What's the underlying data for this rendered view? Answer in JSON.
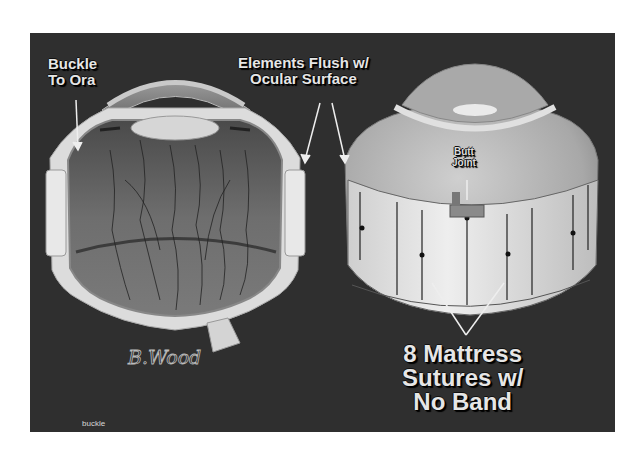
{
  "figure": {
    "type": "medical illustration",
    "labels": {
      "buckle_to_ora": [
        "Buckle",
        "To Ora"
      ],
      "elements_flush": [
        "Elements Flush w/",
        "Ocular Surface"
      ],
      "butt_joint": [
        "Butt",
        "Joint"
      ],
      "sutures": [
        "8 Mattress",
        "Sutures w/",
        "No Band"
      ]
    },
    "signature": "B.Wood",
    "caption": "buckle",
    "suture_count": 8,
    "colors": {
      "background": "#2f2f2f",
      "label_text": "#e6e6e6",
      "sclera": "#d9d9d9",
      "buckle_element": "#e8e8e8"
    }
  }
}
